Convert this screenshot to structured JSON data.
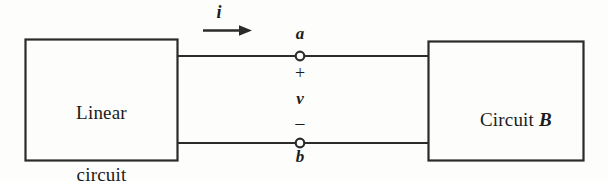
{
  "figure": {
    "kind": "circuit-diagram",
    "background_color": "#fdfdfb",
    "ink_color": "#2b2b2b"
  },
  "blocks": {
    "left": {
      "name": "linear-circuit-a",
      "line1": "Linear",
      "line2": "circuit",
      "designator": "A"
    },
    "right": {
      "name": "circuit-b",
      "text": "Circuit ",
      "designator": "B"
    }
  },
  "labels": {
    "current": "i",
    "terminal_top": "a",
    "terminal_bottom": "b",
    "polarity_plus": "+",
    "polarity_minus": "−",
    "voltage": "v"
  }
}
